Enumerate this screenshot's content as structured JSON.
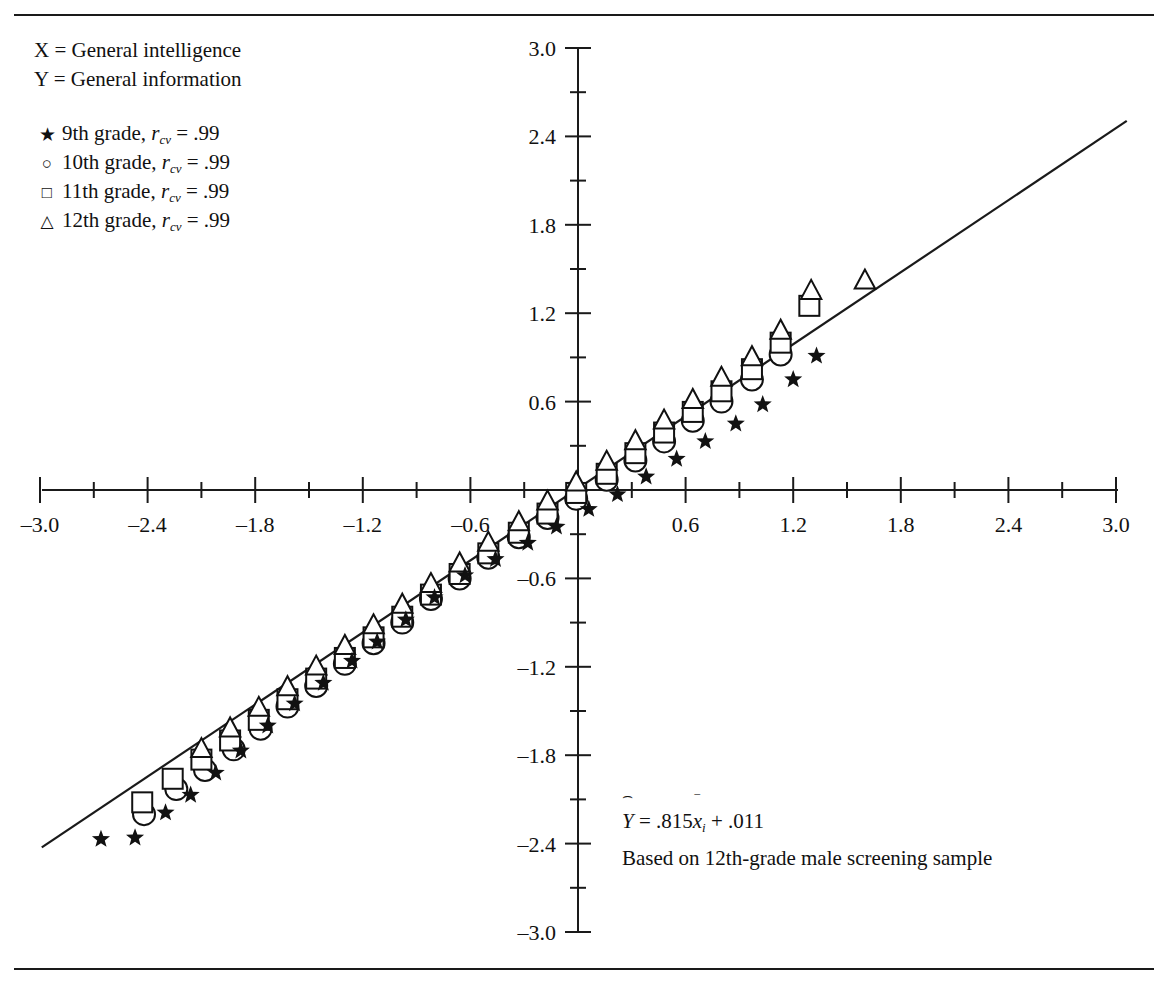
{
  "figure": {
    "variables": [
      "X = General intelligence",
      "Y = General information"
    ],
    "legend": [
      {
        "marker": "star",
        "glyph": "★",
        "grade": "9th grade, ",
        "stat": "r",
        "sub": "cv",
        "eq": " = .99"
      },
      {
        "marker": "circle",
        "glyph": "○",
        "grade": "10th grade, ",
        "stat": "r",
        "sub": "cv",
        "eq": " = .99"
      },
      {
        "marker": "square",
        "glyph": "□",
        "grade": "11th grade, ",
        "stat": "r",
        "sub": "cv",
        "eq": " = .99"
      },
      {
        "marker": "triangle",
        "glyph": "△",
        "grade": "12th grade, ",
        "stat": "r",
        "sub": "cv",
        "eq": " = .99"
      }
    ],
    "annotation": {
      "hat": "⌢",
      "yvar": "Y",
      "equation_rest": " = .815",
      "xvar": "x",
      "xbar": "‾",
      "xsub": "i",
      "equation_tail": " + .011",
      "caption": "Based on 12th-grade male screening sample"
    }
  },
  "chart_data": {
    "type": "scatter",
    "title": "",
    "xlabel": "X = General intelligence",
    "ylabel": "Y = General information",
    "xlim": [
      -3.0,
      3.0
    ],
    "ylim": [
      -3.0,
      3.0
    ],
    "grid": false,
    "legend_position": "top-left",
    "xticks": [
      -3.0,
      -2.4,
      -1.8,
      -1.2,
      -0.6,
      0.6,
      1.2,
      1.8,
      2.4,
      3.0
    ],
    "xtick_labels": [
      "-3.0",
      "-2.4",
      "-1.8",
      "-1.2",
      "-0.6",
      "0.6",
      "1.2",
      "1.8",
      "2.4",
      "3.0"
    ],
    "yticks": [
      -3.0,
      -2.4,
      -1.8,
      -1.2,
      -0.6,
      0.6,
      1.2,
      1.8,
      2.4,
      3.0
    ],
    "ytick_labels": [
      "-3.0",
      "-2.4",
      "-1.8",
      "-1.2",
      "-0.6",
      "0.6",
      "1.2",
      "1.8",
      "2.4",
      "3.0"
    ],
    "minor_tick_step": 0.3,
    "regression_line": {
      "slope": 0.815,
      "intercept": 0.011,
      "x_from": -2.99,
      "x_to": 3.06,
      "label": "Y = .815x̄i + .011"
    },
    "series": [
      {
        "name": "9th grade, r_cv = .99",
        "marker": "star",
        "r_cv": 0.99,
        "points": [
          [
            -2.66,
            -2.37
          ],
          [
            -2.47,
            -2.36
          ],
          [
            -2.3,
            -2.19
          ],
          [
            -2.16,
            -2.07
          ],
          [
            -2.02,
            -1.92
          ],
          [
            -1.88,
            -1.77
          ],
          [
            -1.73,
            -1.6
          ],
          [
            -1.58,
            -1.45
          ],
          [
            -1.42,
            -1.31
          ],
          [
            -1.26,
            -1.16
          ],
          [
            -1.12,
            -1.03
          ],
          [
            -0.96,
            -0.88
          ],
          [
            -0.8,
            -0.73
          ],
          [
            -0.63,
            -0.58
          ],
          [
            -0.46,
            -0.47
          ],
          [
            -0.28,
            -0.36
          ],
          [
            -0.12,
            -0.25
          ],
          [
            0.06,
            -0.13
          ],
          [
            0.22,
            -0.03
          ],
          [
            0.38,
            0.09
          ],
          [
            0.55,
            0.21
          ],
          [
            0.71,
            0.33
          ],
          [
            0.88,
            0.45
          ],
          [
            1.03,
            0.58
          ],
          [
            1.2,
            0.75
          ],
          [
            1.33,
            0.91
          ]
        ]
      },
      {
        "name": "10th grade, r_cv = .99",
        "marker": "circle",
        "r_cv": 0.99,
        "points": [
          [
            -2.42,
            -2.2
          ],
          [
            -2.24,
            -2.03
          ],
          [
            -2.08,
            -1.9
          ],
          [
            -1.92,
            -1.76
          ],
          [
            -1.77,
            -1.62
          ],
          [
            -1.62,
            -1.47
          ],
          [
            -1.46,
            -1.33
          ],
          [
            -1.3,
            -1.18
          ],
          [
            -1.14,
            -1.04
          ],
          [
            -0.98,
            -0.9
          ],
          [
            -0.82,
            -0.74
          ],
          [
            -0.66,
            -0.6
          ],
          [
            -0.5,
            -0.46
          ],
          [
            -0.33,
            -0.32
          ],
          [
            -0.17,
            -0.19
          ],
          [
            -0.01,
            -0.06
          ],
          [
            0.16,
            0.07
          ],
          [
            0.32,
            0.2
          ],
          [
            0.48,
            0.33
          ],
          [
            0.64,
            0.47
          ],
          [
            0.8,
            0.6
          ],
          [
            0.97,
            0.75
          ],
          [
            1.13,
            0.92
          ]
        ]
      },
      {
        "name": "11th grade, r_cv = .99",
        "marker": "square",
        "r_cv": 0.99,
        "points": [
          [
            -2.43,
            -2.12
          ],
          [
            -2.26,
            -1.96
          ],
          [
            -2.1,
            -1.83
          ],
          [
            -1.94,
            -1.7
          ],
          [
            -1.78,
            -1.56
          ],
          [
            -1.62,
            -1.42
          ],
          [
            -1.46,
            -1.28
          ],
          [
            -1.3,
            -1.14
          ],
          [
            -1.14,
            -1.0
          ],
          [
            -0.98,
            -0.86
          ],
          [
            -0.82,
            -0.71
          ],
          [
            -0.66,
            -0.57
          ],
          [
            -0.5,
            -0.43
          ],
          [
            -0.33,
            -0.29
          ],
          [
            -0.17,
            -0.16
          ],
          [
            -0.01,
            -0.02
          ],
          [
            0.16,
            0.11
          ],
          [
            0.32,
            0.25
          ],
          [
            0.48,
            0.39
          ],
          [
            0.64,
            0.53
          ],
          [
            0.8,
            0.67
          ],
          [
            0.97,
            0.82
          ],
          [
            1.13,
            1.0
          ],
          [
            1.29,
            1.25
          ]
        ]
      },
      {
        "name": "12th grade, r_cv = .99",
        "marker": "triangle",
        "r_cv": 0.99,
        "points": [
          [
            -2.1,
            -1.76
          ],
          [
            -1.94,
            -1.62
          ],
          [
            -1.78,
            -1.48
          ],
          [
            -1.62,
            -1.34
          ],
          [
            -1.46,
            -1.2
          ],
          [
            -1.3,
            -1.06
          ],
          [
            -1.14,
            -0.92
          ],
          [
            -0.98,
            -0.78
          ],
          [
            -0.82,
            -0.64
          ],
          [
            -0.66,
            -0.5
          ],
          [
            -0.5,
            -0.36
          ],
          [
            -0.33,
            -0.22
          ],
          [
            -0.17,
            -0.08
          ],
          [
            -0.01,
            0.05
          ],
          [
            0.16,
            0.19
          ],
          [
            0.32,
            0.33
          ],
          [
            0.48,
            0.47
          ],
          [
            0.64,
            0.61
          ],
          [
            0.8,
            0.76
          ],
          [
            0.97,
            0.9
          ],
          [
            1.13,
            1.08
          ],
          [
            1.3,
            1.35
          ],
          [
            1.6,
            1.42
          ]
        ]
      }
    ]
  }
}
